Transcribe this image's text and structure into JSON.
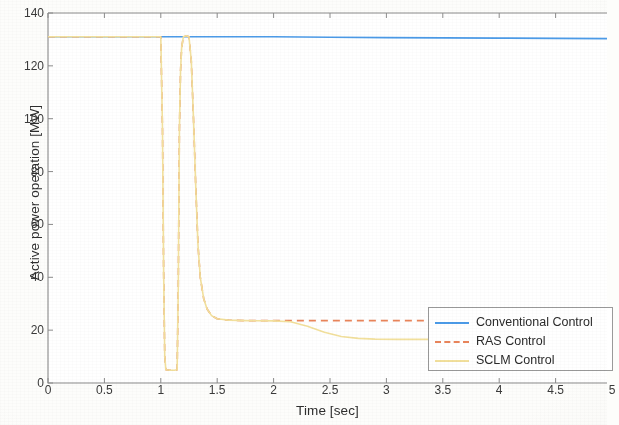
{
  "chart_data": {
    "type": "line",
    "title": "",
    "xlabel": "Time [sec]",
    "ylabel": "Active power operation [MW]",
    "xlim": [
      0,
      5
    ],
    "ylim": [
      0,
      140
    ],
    "xticks": [
      0,
      0.5,
      1,
      1.5,
      2,
      2.5,
      3,
      3.5,
      4,
      4.5,
      5
    ],
    "xtick_labels": [
      "0",
      "0.5",
      "1",
      "1.5",
      "2",
      "2.5",
      "3",
      "3.5",
      "4",
      "4.5",
      "5"
    ],
    "yticks": [
      0,
      20,
      40,
      60,
      80,
      100,
      120,
      140
    ],
    "ytick_labels": [
      "0",
      "20",
      "40",
      "60",
      "80",
      "100",
      "120",
      "140"
    ],
    "grid": false,
    "legend_position": "lower right",
    "series": [
      {
        "name": "Conventional Control",
        "color": "#4C9BE8",
        "style": "solid",
        "width": 1.6,
        "points": [
          [
            0,
            131
          ],
          [
            0.5,
            131
          ],
          [
            1.0,
            131
          ],
          [
            1.2,
            131
          ],
          [
            1.5,
            131
          ],
          [
            2.0,
            131
          ],
          [
            2.5,
            130.8
          ],
          [
            3.0,
            130.7
          ],
          [
            3.5,
            130.6
          ],
          [
            4.0,
            130.5
          ],
          [
            4.5,
            130.4
          ],
          [
            5.0,
            130.3
          ]
        ]
      },
      {
        "name": "RAS Control",
        "color": "#E8845A",
        "style": "dashed",
        "width": 1.6,
        "points": [
          [
            0,
            131
          ],
          [
            0.25,
            131
          ],
          [
            0.5,
            131
          ],
          [
            0.75,
            131
          ],
          [
            1.0,
            131
          ],
          [
            1.015,
            96
          ],
          [
            1.025,
            42
          ],
          [
            1.035,
            10
          ],
          [
            1.045,
            5
          ],
          [
            1.08,
            4.8
          ],
          [
            1.12,
            4.8
          ],
          [
            1.145,
            5
          ],
          [
            1.155,
            36
          ],
          [
            1.165,
            96
          ],
          [
            1.175,
            118
          ],
          [
            1.185,
            127
          ],
          [
            1.2,
            131
          ],
          [
            1.225,
            131.4
          ],
          [
            1.25,
            131
          ],
          [
            1.27,
            122
          ],
          [
            1.29,
            100
          ],
          [
            1.31,
            74
          ],
          [
            1.33,
            52
          ],
          [
            1.35,
            40
          ],
          [
            1.38,
            32
          ],
          [
            1.41,
            28
          ],
          [
            1.45,
            25.5
          ],
          [
            1.5,
            24.3
          ],
          [
            1.6,
            23.8
          ],
          [
            1.75,
            23.6
          ],
          [
            2.0,
            23.6
          ],
          [
            2.5,
            23.6
          ],
          [
            3.0,
            23.6
          ],
          [
            3.5,
            23.6
          ],
          [
            4.0,
            23.6
          ],
          [
            4.5,
            23.6
          ],
          [
            5.0,
            23.6
          ]
        ]
      },
      {
        "name": "SCLM Control",
        "color": "#F2E09C",
        "style": "solid",
        "width": 1.6,
        "points": [
          [
            0,
            131
          ],
          [
            0.25,
            131
          ],
          [
            0.5,
            131
          ],
          [
            0.75,
            131
          ],
          [
            1.0,
            131
          ],
          [
            1.015,
            96
          ],
          [
            1.025,
            42
          ],
          [
            1.035,
            10
          ],
          [
            1.045,
            5
          ],
          [
            1.08,
            4.8
          ],
          [
            1.12,
            4.8
          ],
          [
            1.145,
            5
          ],
          [
            1.155,
            36
          ],
          [
            1.165,
            96
          ],
          [
            1.175,
            118
          ],
          [
            1.185,
            127
          ],
          [
            1.2,
            131
          ],
          [
            1.225,
            131.4
          ],
          [
            1.25,
            131
          ],
          [
            1.27,
            122
          ],
          [
            1.29,
            100
          ],
          [
            1.31,
            74
          ],
          [
            1.33,
            52
          ],
          [
            1.35,
            40
          ],
          [
            1.38,
            32
          ],
          [
            1.41,
            28
          ],
          [
            1.45,
            25.5
          ],
          [
            1.5,
            24.3
          ],
          [
            1.6,
            23.8
          ],
          [
            1.75,
            23.6
          ],
          [
            2.0,
            23.5
          ],
          [
            2.15,
            23.2
          ],
          [
            2.3,
            21.5
          ],
          [
            2.45,
            19.2
          ],
          [
            2.6,
            17.6
          ],
          [
            2.75,
            16.9
          ],
          [
            2.9,
            16.6
          ],
          [
            3.1,
            16.5
          ],
          [
            3.5,
            16.5
          ],
          [
            4.0,
            16.5
          ],
          [
            4.5,
            16.5
          ],
          [
            5.0,
            16.5
          ]
        ]
      }
    ]
  },
  "legend": {
    "entries": [
      {
        "label": "Conventional Control",
        "color": "#4C9BE8",
        "style": "solid"
      },
      {
        "label": "RAS Control",
        "color": "#E8845A",
        "style": "dashed"
      },
      {
        "label": "SCLM Control",
        "color": "#F2E09C",
        "style": "solid"
      }
    ]
  },
  "axes": {
    "box_color": "#8c8c8c",
    "background": "#ffffff"
  }
}
